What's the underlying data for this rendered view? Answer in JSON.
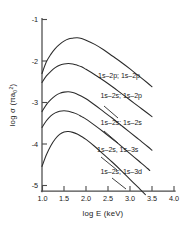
{
  "chart_data": {
    "type": "line",
    "title": "",
    "xlabel": "log E (keV)",
    "ylabel": "log σ (π a₀²)",
    "ylabel_parts": {
      "prefix": "log σ (",
      "pi": "π",
      "a": "a",
      "sub": "0",
      "sup": "2",
      "suffix": ")"
    },
    "xlim": [
      1.0,
      4.0
    ],
    "ylim": [
      -5.0,
      -1.0
    ],
    "xticks": [
      "1.0",
      "1.5",
      "2.0",
      "2.5",
      "3.0",
      "3.5",
      "4.0"
    ],
    "xtick_values": [
      1.0,
      1.5,
      2.0,
      2.5,
      3.0,
      3.5,
      4.0
    ],
    "yticks": [
      "-1",
      "-2",
      "-3",
      "-4",
      "-5"
    ],
    "ytick_values": [
      -1,
      -2,
      -3,
      -4,
      -5
    ],
    "grid": false,
    "legend_position": "inline-right-of-curves",
    "series": [
      {
        "name": "1s-2p; 1s-2p",
        "label": "1s–2p; 1s–2p",
        "peak": {
          "x": 1.8,
          "y": -1.45
        },
        "x": [
          1.0,
          1.1,
          1.2,
          1.3,
          1.4,
          1.5,
          1.6,
          1.7,
          1.8,
          1.9,
          2.0,
          2.2,
          2.4,
          2.6,
          2.8,
          3.0,
          3.2,
          3.4,
          3.5
        ],
        "y": [
          -2.3,
          -2.02,
          -1.84,
          -1.7,
          -1.6,
          -1.52,
          -1.47,
          -1.45,
          -1.44,
          -1.46,
          -1.5,
          -1.6,
          -1.73,
          -1.88,
          -2.03,
          -2.19,
          -2.36,
          -2.53,
          -2.62
        ]
      },
      {
        "name": "1s-2s; 1s-2p",
        "label": "1s–2s; 1s–2p",
        "peak": {
          "x": 1.62,
          "y": -2.06
        },
        "x": [
          1.0,
          1.1,
          1.2,
          1.3,
          1.4,
          1.5,
          1.6,
          1.7,
          1.8,
          1.9,
          2.0,
          2.2,
          2.4,
          2.6,
          2.8,
          3.0,
          3.2,
          3.4,
          3.5
        ],
        "y": [
          -2.52,
          -2.36,
          -2.25,
          -2.16,
          -2.1,
          -2.07,
          -2.06,
          -2.07,
          -2.1,
          -2.14,
          -2.2,
          -2.33,
          -2.47,
          -2.62,
          -2.78,
          -2.94,
          -3.1,
          -3.26,
          -3.34
        ]
      },
      {
        "name": "1s-2s; 1s-2s",
        "label": "1s–2s; 1s–2s",
        "peak": {
          "x": 1.55,
          "y": -2.74
        },
        "x": [
          1.0,
          1.1,
          1.2,
          1.3,
          1.4,
          1.5,
          1.6,
          1.7,
          1.8,
          1.9,
          2.0,
          2.2,
          2.4,
          2.6,
          2.8,
          3.0,
          3.2,
          3.4,
          3.5
        ],
        "y": [
          -3.22,
          -3.05,
          -2.93,
          -2.84,
          -2.78,
          -2.75,
          -2.74,
          -2.76,
          -2.8,
          -2.85,
          -2.91,
          -3.06,
          -3.22,
          -3.38,
          -3.55,
          -3.72,
          -3.89,
          -4.06,
          -4.15
        ]
      },
      {
        "name": "1s-2s, 1s-3s",
        "label": "1s–2s, 1s–3s",
        "peak": {
          "x": 1.48,
          "y": -3.2
        },
        "x": [
          1.0,
          1.1,
          1.2,
          1.3,
          1.4,
          1.5,
          1.6,
          1.7,
          1.8,
          1.9,
          2.0,
          2.2,
          2.4,
          2.6,
          2.8,
          3.0,
          3.2,
          3.4,
          3.45
        ],
        "y": [
          -3.6,
          -3.44,
          -3.32,
          -3.25,
          -3.21,
          -3.2,
          -3.21,
          -3.24,
          -3.28,
          -3.34,
          -3.4,
          -3.55,
          -3.71,
          -3.88,
          -4.05,
          -4.23,
          -4.41,
          -4.59,
          -4.64
        ]
      },
      {
        "name": "1s-2s; 1s-3d",
        "label": "1s–2s; 1s–3d",
        "peak": {
          "x": 1.55,
          "y": -3.7
        },
        "x": [
          1.0,
          1.1,
          1.2,
          1.3,
          1.4,
          1.5,
          1.6,
          1.7,
          1.8,
          1.9,
          2.0,
          2.2,
          2.4,
          2.6,
          2.8,
          3.0,
          3.2,
          3.35
        ],
        "y": [
          -4.54,
          -4.26,
          -4.04,
          -3.88,
          -3.77,
          -3.71,
          -3.7,
          -3.72,
          -3.76,
          -3.82,
          -3.89,
          -4.06,
          -4.25,
          -4.44,
          -4.64,
          -4.85,
          -5.06,
          -5.22
        ]
      }
    ],
    "annotations": [
      {
        "text": "1s–2p; 1s–2p",
        "x": 2.75,
        "y": -2.4,
        "leader": false
      },
      {
        "text": "1s–2s; 1s–2p",
        "x": 2.8,
        "y": -2.9,
        "leader": true
      },
      {
        "text": "1s–2s; 1s–2s",
        "x": 2.8,
        "y": -3.55,
        "leader": true
      },
      {
        "text": "1s–2s, 1s–3s",
        "x": 2.72,
        "y": -4.18,
        "leader": true
      },
      {
        "text": "1s–2s; 1s–3d",
        "x": 2.8,
        "y": -4.72,
        "leader": true
      }
    ]
  },
  "axis": {
    "x_title": "log E (keV)",
    "y_title": "log σ (π a₀²)"
  }
}
